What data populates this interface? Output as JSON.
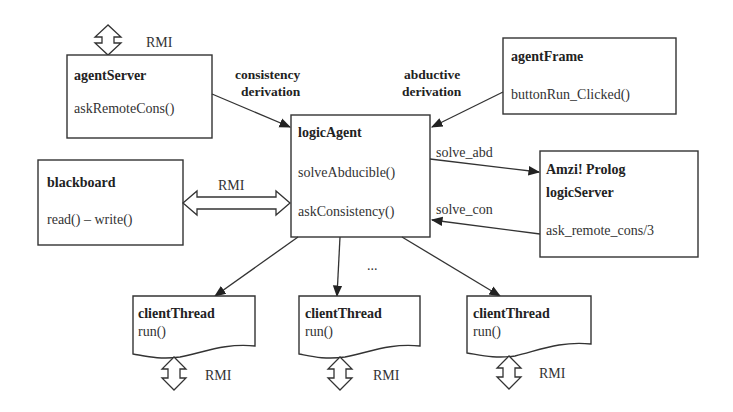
{
  "nodes": {
    "agentServer": {
      "title": "agentServer",
      "method": "askRemoteCons()"
    },
    "agentFrame": {
      "title": "agentFrame",
      "method": "buttonRun_Clicked()"
    },
    "logicAgent": {
      "title": "logicAgent",
      "methods": [
        "solveAbducible()",
        "askConsistency()"
      ]
    },
    "blackboard": {
      "title": "blackboard",
      "method": "read() – write()"
    },
    "amzi": {
      "title_line1": "Amzi! Prolog",
      "title_line2": "logicServer",
      "method": "ask_remote_cons/3"
    },
    "clientThreads": [
      {
        "title": "clientThread",
        "method": "run()"
      },
      {
        "title": "clientThread",
        "method": "run()"
      },
      {
        "title": "clientThread",
        "method": "run()"
      }
    ]
  },
  "edges": {
    "consistency": {
      "line1": "consistency",
      "line2": "derivation"
    },
    "abductive": {
      "line1": "abductive",
      "line2": "derivation"
    },
    "solve_abd": "solve_abd",
    "solve_con": "solve_con",
    "blackboard_rmi": "RMI",
    "ellipsis": "..."
  },
  "rmi_labels": {
    "agentServer": "RMI",
    "client1": "RMI",
    "client2": "RMI",
    "client3": "RMI"
  }
}
